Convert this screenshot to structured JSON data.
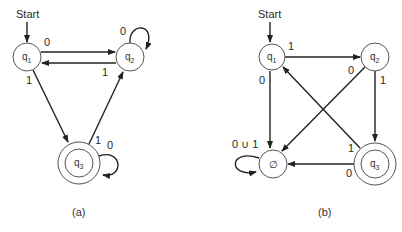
{
  "diagrams": [
    {
      "caption": "(a)",
      "start_label": "Start",
      "states": [
        {
          "id": "q1",
          "label": "q",
          "sub": "1",
          "accepting": false,
          "start": true
        },
        {
          "id": "q2",
          "label": "q",
          "sub": "2",
          "accepting": false,
          "start": false
        },
        {
          "id": "q3",
          "label": "q",
          "sub": "3",
          "accepting": true,
          "start": false
        }
      ],
      "transitions": [
        {
          "from": "q1",
          "to": "q2",
          "symbol": "0"
        },
        {
          "from": "q2",
          "to": "q1",
          "symbol": "1"
        },
        {
          "from": "q2",
          "to": "q2",
          "symbol": "0"
        },
        {
          "from": "q1",
          "to": "q3",
          "symbol": "1"
        },
        {
          "from": "q3",
          "to": "q2",
          "symbol": "1"
        },
        {
          "from": "q3",
          "to": "q3",
          "symbol": "0"
        }
      ]
    },
    {
      "caption": "(b)",
      "start_label": "Start",
      "states": [
        {
          "id": "q1",
          "label": "q",
          "sub": "1",
          "accepting": false,
          "start": true
        },
        {
          "id": "q2",
          "label": "q",
          "sub": "2",
          "accepting": false,
          "start": false
        },
        {
          "id": "empty",
          "label": "∅",
          "sub": "",
          "accepting": false,
          "start": false
        },
        {
          "id": "q3",
          "label": "q",
          "sub": "3",
          "accepting": true,
          "start": false
        }
      ],
      "transitions": [
        {
          "from": "q1",
          "to": "q2",
          "symbol": "1"
        },
        {
          "from": "q1",
          "to": "empty",
          "symbol": "0"
        },
        {
          "from": "q2",
          "to": "empty",
          "symbol": "0"
        },
        {
          "from": "q2",
          "to": "q3",
          "symbol": "1"
        },
        {
          "from": "q3",
          "to": "q1",
          "symbol": "1"
        },
        {
          "from": "q3",
          "to": "empty",
          "symbol": "0"
        },
        {
          "from": "empty",
          "to": "empty",
          "symbol": "0 ∪ 1"
        }
      ]
    }
  ]
}
